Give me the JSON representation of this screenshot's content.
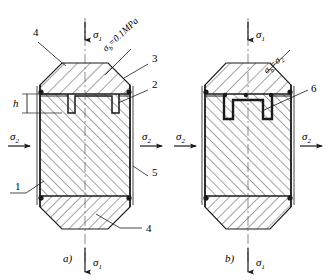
{
  "figure": {
    "stroke_color": "#1a1a1a",
    "background": "#ffffff"
  },
  "panels": [
    {
      "id": "a",
      "caption": "a)",
      "caption_pos": {
        "x": 63,
        "y": 258
      },
      "center_x": 85,
      "top_stress_label": "σ1",
      "bottom_stress_label": "σ1",
      "left_stress_label": "σ2",
      "right_stress_label": "σ2",
      "boundary_label": "σb=0.1MPa",
      "callouts": [
        {
          "text": "4",
          "x": 33,
          "y": 36
        },
        {
          "text": "3",
          "x": 152,
          "y": 62
        },
        {
          "text": "2",
          "x": 152,
          "y": 88
        },
        {
          "text": "1",
          "x": 15,
          "y": 186
        },
        {
          "text": "5",
          "x": 152,
          "y": 172
        },
        {
          "text": "4",
          "x": 145,
          "y": 230
        }
      ],
      "dimension_label": "h"
    },
    {
      "id": "b",
      "caption": "b)",
      "caption_pos": {
        "x": 225,
        "y": 258
      },
      "center_x": 248,
      "top_stress_label": "σ1",
      "bottom_stress_label": "σ1",
      "left_stress_label": "σ2",
      "right_stress_label": "σ2",
      "boundary_label": "σb=σ2",
      "callouts": [
        {
          "text": "6",
          "x": 311,
          "y": 88
        }
      ]
    }
  ],
  "symbols": {
    "sigma": "σ",
    "sub_1": "1",
    "sub_2": "2",
    "sub_b": "b",
    "pressure_value": "0.1MPa"
  }
}
